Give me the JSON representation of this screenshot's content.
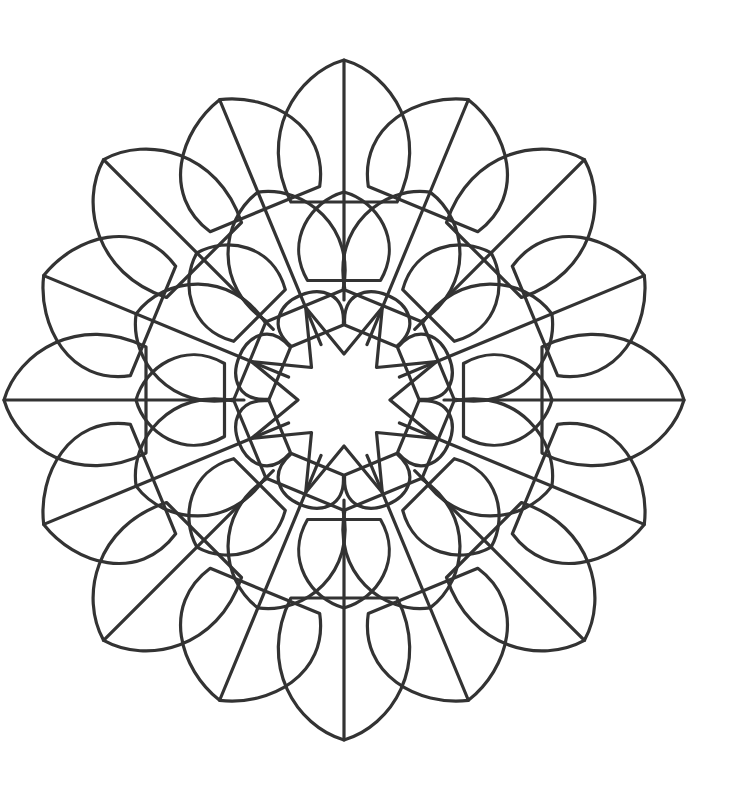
{
  "image": {
    "kind": "mandala-coloring-page",
    "width": 739,
    "height": 797,
    "background": "#ffffff",
    "stroke": "#333333",
    "stroke_width": 3.2
  },
  "mandala": {
    "center": [
      344,
      400
    ],
    "symmetry": 8,
    "star": {
      "points": 8,
      "inner_r": 46,
      "outer_r": 100
    },
    "inner_lobes": {
      "count": 8,
      "offset_deg": 22.5,
      "base_r": 75,
      "tip_r": 130,
      "half_width_deg": 22
    },
    "mid_petals": {
      "count": 8,
      "offset_deg": 0,
      "base_r": 125,
      "tip_r": 208,
      "half_width_deg": 17
    },
    "heart_petals": {
      "count": 8,
      "offset_deg": 22.5,
      "base_r": 110,
      "tip_r": 225,
      "half_width_deg": 22
    },
    "outer_main_petals": {
      "count": 8,
      "offset_deg": 0,
      "base_r": 205,
      "tip_r": 340,
      "half_width_deg": 15
    },
    "outer_side_petals": {
      "count": 8,
      "offset_deg": 22.5,
      "base_r": 215,
      "tip_r": 325,
      "half_width_deg": 16
    },
    "rays": [
      {
        "offset_deg": 0,
        "from_r": 100,
        "to_r": 340
      },
      {
        "offset_deg": 22.5,
        "from_r": 60,
        "to_r": 325
      }
    ]
  }
}
